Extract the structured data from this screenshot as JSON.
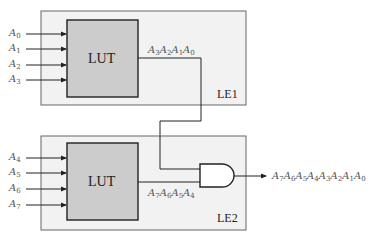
{
  "diagram": {
    "le1": {
      "name": "LE1",
      "lut_label": "LUT",
      "inputs": [
        {
          "base": "A",
          "sub": "0"
        },
        {
          "base": "A",
          "sub": "1"
        },
        {
          "base": "A",
          "sub": "2"
        },
        {
          "base": "A",
          "sub": "3"
        }
      ],
      "output": [
        {
          "base": "A",
          "sub": "3"
        },
        {
          "base": "A",
          "sub": "2"
        },
        {
          "base": "A",
          "sub": "1"
        },
        {
          "base": "A",
          "sub": "0"
        }
      ]
    },
    "le2": {
      "name": "LE2",
      "lut_label": "LUT",
      "inputs": [
        {
          "base": "A",
          "sub": "4"
        },
        {
          "base": "A",
          "sub": "5"
        },
        {
          "base": "A",
          "sub": "6"
        },
        {
          "base": "A",
          "sub": "7"
        }
      ],
      "output": [
        {
          "base": "A",
          "sub": "7"
        },
        {
          "base": "A",
          "sub": "6"
        },
        {
          "base": "A",
          "sub": "5"
        },
        {
          "base": "A",
          "sub": "4"
        }
      ]
    },
    "gate": "AND",
    "final_output": [
      {
        "base": "A",
        "sub": "7"
      },
      {
        "base": "A",
        "sub": "6"
      },
      {
        "base": "A",
        "sub": "5"
      },
      {
        "base": "A",
        "sub": "4"
      },
      {
        "base": "A",
        "sub": "3"
      },
      {
        "base": "A",
        "sub": "2"
      },
      {
        "base": "A",
        "sub": "1"
      },
      {
        "base": "A",
        "sub": "0"
      }
    ],
    "colors": {
      "le_fill": "#f2f2f2",
      "le_stroke": "#666666",
      "lut_fill": "#cccccc",
      "lut_stroke": "#222222",
      "wire": "#222222"
    }
  }
}
